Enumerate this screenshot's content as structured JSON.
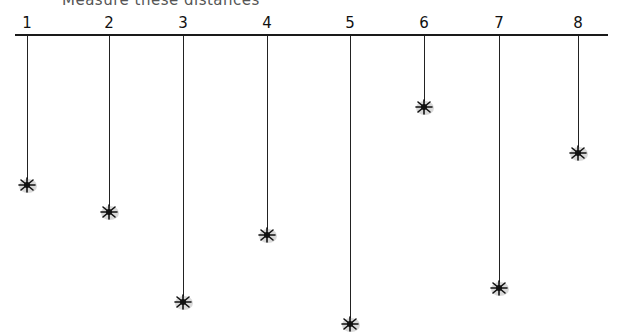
{
  "title": "Measure these distances",
  "baseline": {
    "x1": 15,
    "x2": 608,
    "y": 35
  },
  "spiders": [
    {
      "label": "1",
      "x": 27,
      "y": 185
    },
    {
      "label": "2",
      "x": 109,
      "y": 212
    },
    {
      "label": "3",
      "x": 183,
      "y": 302
    },
    {
      "label": "4",
      "x": 267,
      "y": 235
    },
    {
      "label": "5",
      "x": 350,
      "y": 324
    },
    {
      "label": "6",
      "x": 424,
      "y": 107
    },
    {
      "label": "7",
      "x": 499,
      "y": 288
    },
    {
      "label": "8",
      "x": 578,
      "y": 153
    }
  ],
  "colors": {
    "line": "#1a1a1a",
    "spider": "#111111",
    "shadow": "#cfcfcf"
  }
}
